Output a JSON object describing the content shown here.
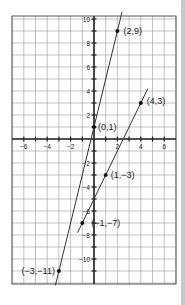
{
  "chart_data": {
    "type": "line",
    "title": "",
    "xlabel": "",
    "ylabel": "",
    "xlim": [
      -7,
      7
    ],
    "ylim": [
      -12,
      10
    ],
    "grid": true,
    "x_ticks": [
      -6,
      -4,
      -2,
      2,
      4,
      6
    ],
    "y_ticks": [
      10,
      8,
      6,
      4,
      2,
      -2,
      -4,
      -6,
      -8,
      -10
    ],
    "series": [
      {
        "name": "Line through (2,9), (0,1), (-3,-11)",
        "equation": "y = 4x + 1",
        "points": [
          {
            "x": 2,
            "y": 9,
            "label": "(2,9)"
          },
          {
            "x": 0,
            "y": 1,
            "label": "(0,1)"
          },
          {
            "x": -3,
            "y": -11,
            "label": "(−3,−11)"
          }
        ],
        "extent_x": [
          -3.3,
          2.4
        ]
      },
      {
        "name": "Line through (4,3), (1,-3), (-1,-7)",
        "equation": "y = 2x - 5",
        "points": [
          {
            "x": 4,
            "y": 3,
            "label": "(4,3)"
          },
          {
            "x": 1,
            "y": -3,
            "label": "(1,−3)"
          },
          {
            "x": -1,
            "y": -7,
            "label": "(−1,−7)"
          }
        ],
        "extent_x": [
          -1.4,
          4.6
        ]
      }
    ],
    "colors": {
      "line": "#333333",
      "grid": "#9a9a9a",
      "axis": "#222222",
      "point": "#111111"
    }
  }
}
